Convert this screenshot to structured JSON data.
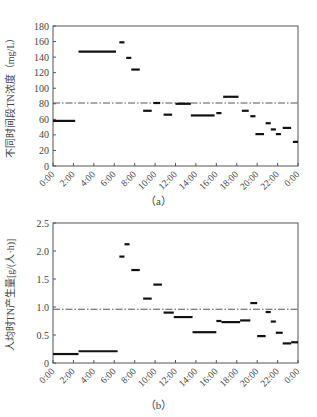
{
  "chart_data": [
    {
      "type": "line",
      "panel": "a",
      "caption": "（a）",
      "title": "",
      "xlabel": "",
      "ylabel": "不同时间段TN浓度（mg/L）",
      "ylim": [
        0,
        180
      ],
      "yticks": [
        0,
        20,
        40,
        60,
        80,
        100,
        120,
        140,
        160,
        180
      ],
      "xlim": [
        0,
        24
      ],
      "xticks": [
        "0:00",
        "2:00",
        "4:00",
        "6:00",
        "8:00",
        "10:00",
        "12:00",
        "14:00",
        "16:00",
        "18:00",
        "20:00",
        "22:00",
        "0:00"
      ],
      "grid": false,
      "reference_line": {
        "style": "dash-dot",
        "value": 81
      },
      "segments": [
        {
          "start": 0.0,
          "end": 2.17,
          "value": 58
        },
        {
          "start": 2.5,
          "end": 6.17,
          "value": 147
        },
        {
          "start": 6.5,
          "end": 7.0,
          "value": 159
        },
        {
          "start": 7.17,
          "end": 7.67,
          "value": 139
        },
        {
          "start": 7.67,
          "end": 8.5,
          "value": 124
        },
        {
          "start": 8.83,
          "end": 9.67,
          "value": 71
        },
        {
          "start": 9.83,
          "end": 10.5,
          "value": 81
        },
        {
          "start": 10.83,
          "end": 11.67,
          "value": 66
        },
        {
          "start": 12.0,
          "end": 13.5,
          "value": 80
        },
        {
          "start": 13.5,
          "end": 15.83,
          "value": 65
        },
        {
          "start": 16.0,
          "end": 16.5,
          "value": 68
        },
        {
          "start": 16.67,
          "end": 18.17,
          "value": 89
        },
        {
          "start": 18.5,
          "end": 19.17,
          "value": 71
        },
        {
          "start": 19.33,
          "end": 19.83,
          "value": 64
        },
        {
          "start": 19.83,
          "end": 20.67,
          "value": 41
        },
        {
          "start": 20.83,
          "end": 21.33,
          "value": 55
        },
        {
          "start": 21.33,
          "end": 21.83,
          "value": 47
        },
        {
          "start": 21.83,
          "end": 22.33,
          "value": 41
        },
        {
          "start": 22.5,
          "end": 23.33,
          "value": 49
        },
        {
          "start": 23.5,
          "end": 24.0,
          "value": 31
        }
      ]
    },
    {
      "type": "line",
      "panel": "b",
      "caption": "（b）",
      "title": "",
      "xlabel": "",
      "ylabel": "人均时TN产生量[g/(人·h)]",
      "ylim": [
        0,
        2.5
      ],
      "yticks": [
        0,
        0.5,
        1.0,
        1.5,
        2.0,
        2.5
      ],
      "yticklabels": [
        "0",
        "0.5",
        "1.0",
        "1.5",
        "2.0",
        "2.5"
      ],
      "xlim": [
        0,
        24
      ],
      "xticks": [
        "0:00",
        "2:00",
        "4:00",
        "6:00",
        "8:00",
        "10:00",
        "12:00",
        "14:00",
        "16:00",
        "18:00",
        "20:00",
        "22:00",
        "0:00"
      ],
      "grid": false,
      "reference_line": {
        "style": "dash-dot",
        "value": 0.96
      },
      "segments": [
        {
          "start": 0.0,
          "end": 2.5,
          "value": 0.16
        },
        {
          "start": 2.5,
          "end": 6.33,
          "value": 0.21
        },
        {
          "start": 6.5,
          "end": 7.0,
          "value": 1.9
        },
        {
          "start": 7.0,
          "end": 7.5,
          "value": 2.12
        },
        {
          "start": 7.67,
          "end": 8.5,
          "value": 1.66
        },
        {
          "start": 8.83,
          "end": 9.67,
          "value": 1.15
        },
        {
          "start": 9.83,
          "end": 10.67,
          "value": 1.4
        },
        {
          "start": 10.83,
          "end": 11.83,
          "value": 0.9
        },
        {
          "start": 11.83,
          "end": 13.67,
          "value": 0.82
        },
        {
          "start": 13.67,
          "end": 16.0,
          "value": 0.55
        },
        {
          "start": 16.0,
          "end": 16.5,
          "value": 0.75
        },
        {
          "start": 16.5,
          "end": 18.33,
          "value": 0.73
        },
        {
          "start": 18.33,
          "end": 19.33,
          "value": 0.76
        },
        {
          "start": 19.33,
          "end": 20.0,
          "value": 1.07
        },
        {
          "start": 20.0,
          "end": 20.83,
          "value": 0.48
        },
        {
          "start": 20.83,
          "end": 21.33,
          "value": 0.91
        },
        {
          "start": 21.33,
          "end": 21.83,
          "value": 0.74
        },
        {
          "start": 21.83,
          "end": 22.5,
          "value": 0.54
        },
        {
          "start": 22.5,
          "end": 23.33,
          "value": 0.35
        },
        {
          "start": 23.33,
          "end": 24.0,
          "value": 0.37
        }
      ]
    }
  ],
  "style": {
    "axis_color": "#555555",
    "segment_color": "#111111",
    "reference_color": "#555555",
    "text_color": "#444444"
  }
}
